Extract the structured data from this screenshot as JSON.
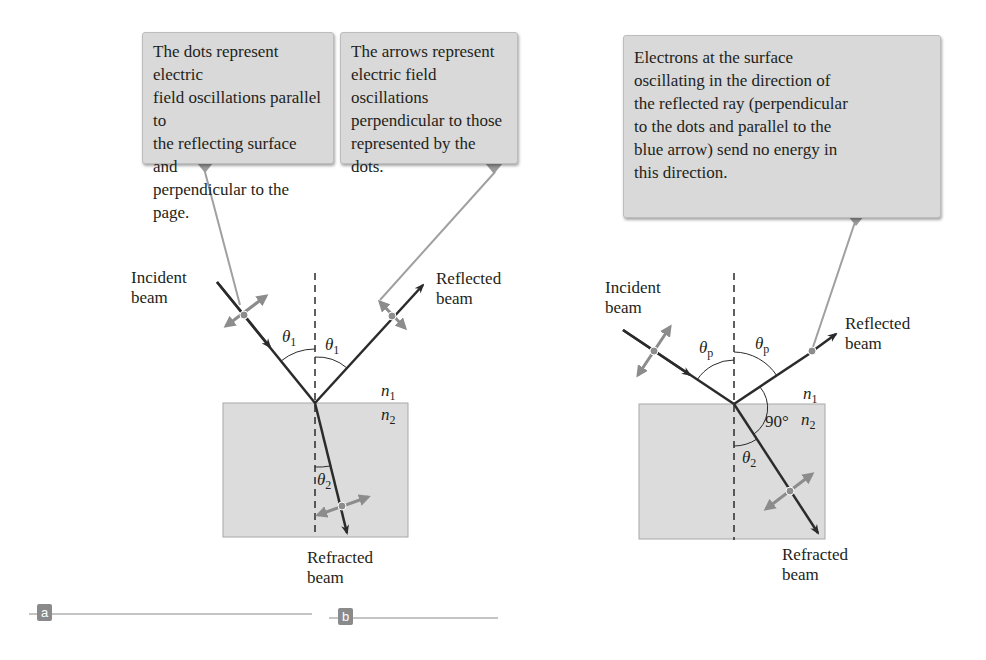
{
  "panel_a": {
    "tag": "a",
    "callout_dots": "The dots represent electric\nfield oscillations parallel to\nthe reflecting surface and\nperpendicular to the page.",
    "callout_arrows": "The arrows represent\nelectric field oscillations\nperpendicular to those\nrepresented by the dots.",
    "incident_label": "Incident\nbeam",
    "reflected_label": "Reflected\nbeam",
    "refracted_label": "Refracted\nbeam",
    "theta_incident": "θ",
    "theta_incident_sub": "1",
    "theta_reflected": "θ",
    "theta_reflected_sub": "1",
    "theta_refracted": "θ",
    "theta_refracted_sub": "2",
    "n1": "n",
    "n1_sub": "1",
    "n2": "n",
    "n2_sub": "2"
  },
  "panel_b": {
    "tag": "b",
    "callout": "Electrons at the surface\noscillating in the direction of\nthe reflected ray (perpendicular\nto the dots and parallel to the\nblue arrow) send no energy in\nthis direction.",
    "incident_label": "Incident\nbeam",
    "reflected_label": "Reflected\nbeam",
    "refracted_label": "Refracted\nbeam",
    "theta_incident": "θ",
    "theta_incident_sub": "p",
    "theta_reflected": "θ",
    "theta_reflected_sub": "p",
    "theta_refracted": "θ",
    "theta_refracted_sub": "2",
    "right_angle": "90°",
    "n1": "n",
    "n1_sub": "1",
    "n2": "n",
    "n2_sub": "2"
  },
  "colors": {
    "callout_bg": "#d9d9d9",
    "medium_fill": "#dcdcdc",
    "ray": "#2b2b2b",
    "polarization": "#8c8c8c",
    "leader": "#9a9a9a"
  }
}
